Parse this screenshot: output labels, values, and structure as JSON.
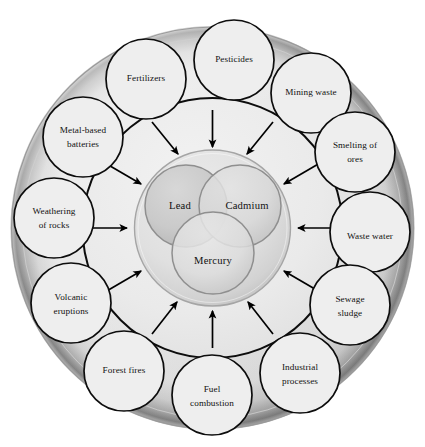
{
  "figure": {
    "type": "concentric-circular-diagram",
    "background_color": "#ffffff"
  },
  "colors": {
    "outer_ring_fill": "#e4e4e4",
    "outer_ring_edge": "#8a8a8a",
    "middle_ring_fill": "#ececec",
    "inner_disc_fill": "#e0e0e0",
    "core_circle_fill": "#cfcfcf",
    "core_circle_light": "#dcdcdc",
    "stroke": "#0d0d0d",
    "arrow": "#000000",
    "text": "#111111"
  },
  "core": {
    "circles": [
      {
        "id": "lead",
        "label": "Lead",
        "position": "upper-left",
        "fill": "#c8c8c8"
      },
      {
        "id": "cadmium",
        "label": "Cadmium",
        "position": "upper-right",
        "fill": "#d9d9d9"
      },
      {
        "id": "mercury",
        "label": "Mercury",
        "position": "bottom",
        "fill": "#dedede"
      }
    ]
  },
  "sources": [
    {
      "id": "pesticides",
      "label": "Pesticides",
      "lines": [
        "Pesticides"
      ],
      "angle_deg": -90
    },
    {
      "id": "mining-waste",
      "label": "Mining waste",
      "lines": [
        "Mining waste"
      ],
      "angle_deg": -60
    },
    {
      "id": "smelting-of-ores",
      "label": "Smelting of ores",
      "lines": [
        "Smelting of",
        "ores"
      ],
      "angle_deg": -30
    },
    {
      "id": "waste-water",
      "label": "Waste water",
      "lines": [
        "Waste water"
      ],
      "angle_deg": 0
    },
    {
      "id": "sewage-sludge",
      "label": "Sewage sludge",
      "lines": [
        "Sewage",
        "sludge"
      ],
      "angle_deg": 30
    },
    {
      "id": "industrial-processes",
      "label": "Industrial processes",
      "lines": [
        "Industrial",
        "processes"
      ],
      "angle_deg": 60
    },
    {
      "id": "fuel-combustion",
      "label": "Fuel combustion",
      "lines": [
        "Fuel",
        "combustion"
      ],
      "angle_deg": 90
    },
    {
      "id": "forest-fires",
      "label": "Forest fires",
      "lines": [
        "Forest fires"
      ],
      "angle_deg": 120
    },
    {
      "id": "volcanic-eruptions",
      "label": "Volcanic eruptions",
      "lines": [
        "Volcanic",
        "eruptions"
      ],
      "angle_deg": 150
    },
    {
      "id": "weathering-of-rocks",
      "label": "Weathering of rocks",
      "lines": [
        "Weathering",
        "of rocks"
      ],
      "angle_deg": 180
    },
    {
      "id": "metal-based-batteries",
      "label": "Metal-based batteries",
      "lines": [
        "Metal-based",
        "batteries"
      ],
      "angle_deg": -150
    },
    {
      "id": "fertilizers",
      "label": "Fertilizers",
      "lines": [
        "Fertilizers"
      ],
      "angle_deg": -120
    }
  ],
  "arrows": {
    "count": 12,
    "direction": "inward",
    "description": "One arrow from each source circle pointing toward the central heavy-metal cluster"
  }
}
